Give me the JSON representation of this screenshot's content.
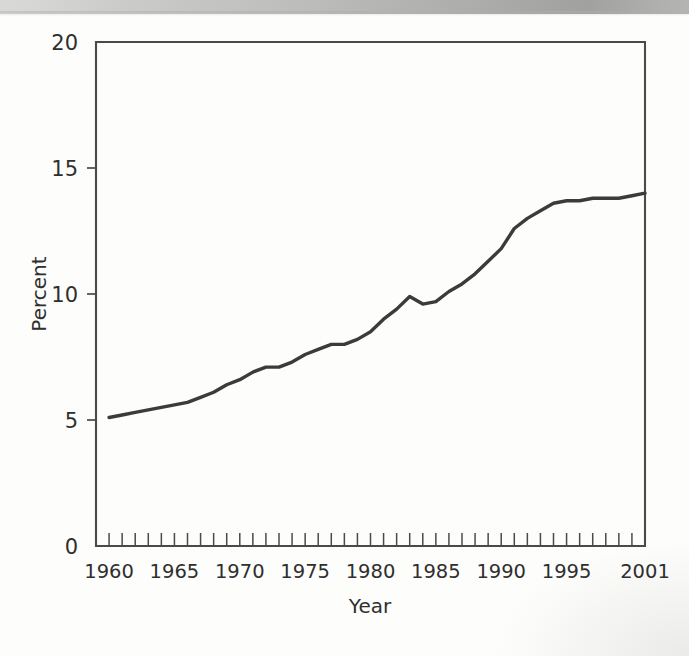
{
  "chart_data": {
    "type": "line",
    "title": "",
    "xlabel": "Year",
    "ylabel": "Percent",
    "xlim": [
      1959,
      2001
    ],
    "ylim": [
      0,
      20
    ],
    "grid": false,
    "legend": null,
    "y_ticks": [
      0,
      5,
      10,
      15,
      20
    ],
    "y_tick_labels": [
      "0",
      "5",
      "10",
      "15",
      "20"
    ],
    "x_tick_labels": [
      "1960",
      "1965",
      "1970",
      "1975",
      "1980",
      "1985",
      "1990",
      "1995",
      "2001"
    ],
    "x_tick_label_years": [
      1960,
      1965,
      1970,
      1975,
      1980,
      1985,
      1990,
      1995,
      2001
    ],
    "x_minor_tick_interval": 1,
    "line_color": "#3b3b3b",
    "axis_color": "#4a4a4a",
    "series": [
      {
        "name": "Percent",
        "x": [
          1960,
          1961,
          1962,
          1963,
          1964,
          1965,
          1966,
          1967,
          1968,
          1969,
          1970,
          1971,
          1972,
          1973,
          1974,
          1975,
          1976,
          1977,
          1978,
          1979,
          1980,
          1981,
          1982,
          1983,
          1984,
          1985,
          1986,
          1987,
          1988,
          1989,
          1990,
          1991,
          1992,
          1993,
          1994,
          1995,
          1996,
          1997,
          1998,
          1999,
          2000,
          2001
        ],
        "values": [
          5.1,
          5.2,
          5.3,
          5.4,
          5.5,
          5.6,
          5.7,
          5.9,
          6.1,
          6.4,
          6.6,
          6.9,
          7.1,
          7.1,
          7.3,
          7.6,
          7.8,
          8.0,
          8.0,
          8.2,
          8.5,
          9.0,
          9.4,
          9.9,
          9.6,
          9.7,
          10.1,
          10.4,
          10.8,
          11.3,
          11.8,
          12.6,
          13.0,
          13.3,
          13.6,
          13.7,
          13.7,
          13.8,
          13.8,
          13.8,
          13.9,
          14.0
        ]
      }
    ]
  },
  "axis_titles": {
    "y": "Percent",
    "x": "Year"
  }
}
